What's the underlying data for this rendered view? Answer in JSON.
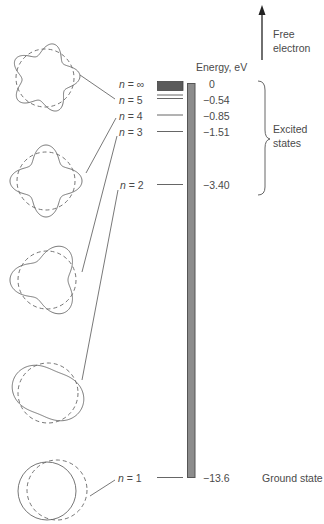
{
  "axis_label": "Energy, eV",
  "free_electron_label": "Free electron",
  "free_electron_lines": [
    "Free",
    "electron"
  ],
  "excited_states_lines": [
    "Excited",
    "states"
  ],
  "ground_state_label": "Ground state",
  "levels": [
    {
      "n": "∞",
      "label_prefix": "n",
      "label": "= ∞",
      "energy": "0"
    },
    {
      "n": "5",
      "label_prefix": "n",
      "label": "= 5",
      "energy": "−0.54"
    },
    {
      "n": "4",
      "label_prefix": "n",
      "label": "= 4",
      "energy": "−0.85"
    },
    {
      "n": "3",
      "label_prefix": "n",
      "label": "= 3",
      "energy": "−1.51"
    },
    {
      "n": "2",
      "label_prefix": "n",
      "label": "= 2",
      "energy": "−3.40"
    },
    {
      "n": "1",
      "label_prefix": "n",
      "label": "= 1",
      "energy": "−13.6"
    }
  ],
  "orbits": [
    {
      "n": 5,
      "description": "standing wave with 5 wavelengths around orbit"
    },
    {
      "n": 4,
      "description": "standing wave with 4 wavelengths around orbit"
    },
    {
      "n": 3,
      "description": "standing wave with 3 wavelengths around orbit"
    },
    {
      "n": 2,
      "description": "standing wave with 2 wavelengths around orbit"
    },
    {
      "n": 1,
      "description": "standing wave with 1 wavelength around orbit"
    }
  ],
  "colors": {
    "bar": "#8c8c8c",
    "bar_border": "#5a5a5a",
    "continuum": "#5b5b5b",
    "line": "#555555",
    "text": "#4a4a4a"
  }
}
